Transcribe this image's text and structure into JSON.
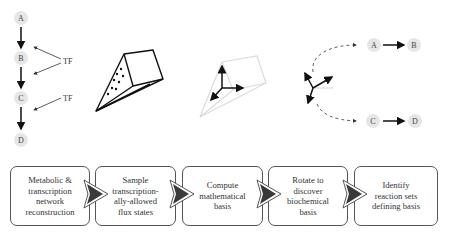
{
  "pathway": {
    "nodes": [
      "A",
      "B",
      "C",
      "D"
    ],
    "regulators": [
      "TF",
      "TF"
    ]
  },
  "rotated_pathways": {
    "top": {
      "from": "A",
      "to": "B"
    },
    "bottom": {
      "from": "C",
      "to": "D"
    }
  },
  "steps": [
    {
      "label": "Metabolic &\ntranscription\nnetwork\nreconstruction"
    },
    {
      "label": "Sample\ntranscription-\nally-allowed\nflux states"
    },
    {
      "label": "Compute\nmathematical\nbasis"
    },
    {
      "label": "Rotate to\ndiscover\nbiochemical\nbasis"
    },
    {
      "label": "Identify\nreaction sets\ndefining basis"
    }
  ],
  "colors": {
    "node_fill": "#e6e6e6",
    "arrow": "#111111",
    "faded": "#d8d8d8",
    "chevron_fill": "#3a3a3a",
    "box_border": "#555555"
  }
}
